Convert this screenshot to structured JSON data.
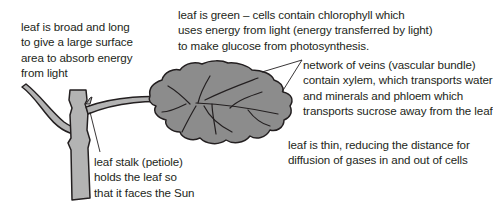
{
  "diagram": {
    "labels": {
      "broad": "leaf is broad and long\nto give a large surface\narea to absorb energy\nfrom light",
      "green": "leaf is green – cells contain chlorophyll which\nuses energy from light (energy transferred by light)\nto make glucose from photosynthesis.",
      "veins": "network of veins (vascular bundle)\ncontain xylem, which transports water\nand minerals and phloem which\ntransports sucrose away from the leaf",
      "thin": "leaf is thin, reducing the distance for\ndiffusion of gases in and out of cells",
      "stalk": "leaf stalk (petiole)\nholds the leaf so\nthat it faces the Sun"
    },
    "parts": [
      "stem",
      "branch",
      "leaf-stalk",
      "leaf-blade",
      "veins"
    ],
    "colors": {
      "leaf_fill": "#8c8c8c",
      "stem_fill": "#b3b3b3",
      "outline": "#231f20",
      "text": "#231f20"
    }
  }
}
